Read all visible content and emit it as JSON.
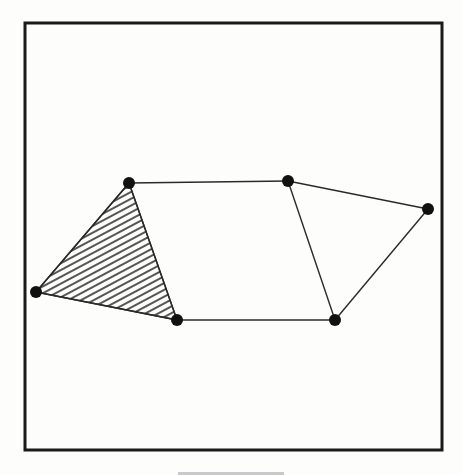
{
  "figure": {
    "frame": {
      "x": 25,
      "y": 23,
      "width": 417,
      "height": 427,
      "stroke": "#1a1a1a",
      "stroke_width": 3
    },
    "colors": {
      "background": "#fdfdfb",
      "line": "#2a2a2a",
      "vertex": "#111111",
      "hatch": "#2a2a2a"
    },
    "vertex_radius": 6,
    "vertices": [
      {
        "id": "v1",
        "x": 129,
        "y": 183
      },
      {
        "id": "v2",
        "x": 36,
        "y": 292
      },
      {
        "id": "v3",
        "x": 177,
        "y": 320
      },
      {
        "id": "v4",
        "x": 288,
        "y": 181
      },
      {
        "id": "v5",
        "x": 428,
        "y": 209
      },
      {
        "id": "v6",
        "x": 335,
        "y": 320
      }
    ],
    "edges": [
      [
        "v1",
        "v2"
      ],
      [
        "v2",
        "v3"
      ],
      [
        "v3",
        "v1"
      ],
      [
        "v1",
        "v4"
      ],
      [
        "v3",
        "v6"
      ],
      [
        "v4",
        "v5"
      ],
      [
        "v5",
        "v6"
      ],
      [
        "v4",
        "v6"
      ]
    ],
    "faces": [
      {
        "id": "face-left-triangle",
        "vertices": [
          "v1",
          "v2",
          "v3"
        ],
        "fill": "hatched"
      },
      {
        "id": "face-middle-quad",
        "vertices": [
          "v1",
          "v4",
          "v6",
          "v3"
        ],
        "fill": "none"
      },
      {
        "id": "face-right-triangle",
        "vertices": [
          "v4",
          "v5",
          "v6"
        ],
        "fill": "none"
      }
    ],
    "hatch": {
      "angle_deg": -28,
      "spacing": 6,
      "stroke_width": 1.6
    }
  }
}
